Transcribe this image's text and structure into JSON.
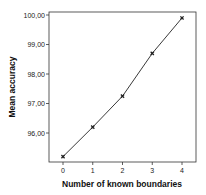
{
  "chart_data": {
    "type": "line",
    "title": "",
    "xlabel": "Number of known boundaries",
    "ylabel": "Mean accuracy",
    "x": [
      0,
      1,
      2,
      3,
      4
    ],
    "series": [
      {
        "name": "Mean accuracy",
        "values": [
          95.2,
          96.2,
          97.25,
          98.7,
          99.9
        ],
        "marker": "x",
        "color": "#222222"
      }
    ],
    "x_ticks": [
      "0",
      "1",
      "2",
      "3",
      "4"
    ],
    "y_ticks": [
      "96,00",
      "97,00",
      "98,00",
      "99,00",
      "100,00"
    ],
    "ylim": [
      95.0,
      100.1
    ],
    "xlim": [
      -0.45,
      4.5
    ],
    "grid": false,
    "legend": "none"
  }
}
